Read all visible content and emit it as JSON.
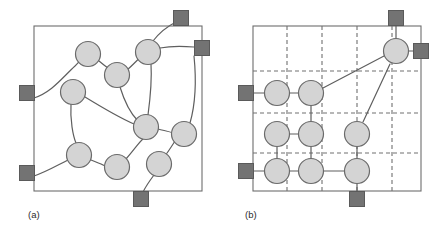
{
  "figure": {
    "background_color": "#ffffff",
    "panels": [
      {
        "id": "a",
        "label": "(a)",
        "label_x": 28,
        "label_y": 218,
        "kind": "irregular-network",
        "frame": {
          "x": 34,
          "y": 26,
          "width": 168,
          "height": 165
        },
        "style": {
          "frame_stroke": "#6d6d6d",
          "frame_fill": "#ffffff",
          "frame_stroke_width": 1.1,
          "node_fill": "#d4d4d4",
          "node_stroke": "#6a6a6a",
          "node_stroke_width": 1.2,
          "node_radius": 12.5,
          "terminal_fill": "#737373",
          "terminal_stroke": "#5a5a5a",
          "terminal_size": 15,
          "edge_stroke": "#5f5f5f",
          "edge_stroke_width": 1.2
        },
        "nodes": [
          {
            "name": "node-a1",
            "x": 88,
            "y": 54
          },
          {
            "name": "node-a2",
            "x": 148,
            "y": 52
          },
          {
            "name": "node-a3",
            "x": 117,
            "y": 75
          },
          {
            "name": "node-a4",
            "x": 73,
            "y": 92
          },
          {
            "name": "node-a5",
            "x": 146,
            "y": 127
          },
          {
            "name": "node-a6",
            "x": 184,
            "y": 134
          },
          {
            "name": "node-a7",
            "x": 79,
            "y": 155
          },
          {
            "name": "node-a8",
            "x": 117,
            "y": 167
          },
          {
            "name": "node-a9",
            "x": 159,
            "y": 164
          }
        ],
        "terminals": [
          {
            "name": "terminal-a-top",
            "x": 181,
            "y": 18
          },
          {
            "name": "terminal-a-right",
            "x": 202,
            "y": 48
          },
          {
            "name": "terminal-a-left-upper",
            "x": 27,
            "y": 93
          },
          {
            "name": "terminal-a-left-lower",
            "x": 27,
            "y": 173
          },
          {
            "name": "terminal-a-bottom",
            "x": 141,
            "y": 199
          }
        ],
        "edges": [
          {
            "name": "edge-a-left-to-n1",
            "path": "M 34 98 C 52 92 62 78 75 66 C 79 62 82 58 85 56"
          },
          {
            "name": "edge-a-n1-to-n3",
            "path": "M 99 61 C 105 66 110 70 116 73"
          },
          {
            "name": "edge-a-n3-to-n2",
            "path": "M 127 70 C 134 64 139 58 144 54"
          },
          {
            "name": "edge-a-n2-to-top",
            "path": "M 153 41 C 160 32 168 26 176 22"
          },
          {
            "name": "edge-a-n2-to-right",
            "path": "M 160 48 C 170 46 182 46 194 47"
          },
          {
            "name": "edge-a-n2-to-n5",
            "path": "M 151 64 C 152 80 150 100 148 115"
          },
          {
            "name": "edge-a-n3-to-n5",
            "path": "M 120 87 C 124 100 129 112 138 121"
          },
          {
            "name": "edge-a-n4-to-n5",
            "path": "M 85 97 C 103 108 120 118 134 124"
          },
          {
            "name": "edge-a-n4-to-n7",
            "path": "M 71 104 C 70 120 73 136 76 143"
          },
          {
            "name": "edge-a-n7-to-left",
            "path": "M 68 160 C 56 166 46 172 34 176"
          },
          {
            "name": "edge-a-n7-to-n8",
            "path": "M 91 160 C 98 163 104 165 105 166"
          },
          {
            "name": "edge-a-n8-to-n5",
            "path": "M 126 159 C 134 150 140 141 143 139"
          },
          {
            "name": "edge-a-n5-to-n6",
            "path": "M 158 129 C 166 131 172 132 172 133"
          },
          {
            "name": "edge-a-n6-to-right",
            "path": "M 190 123 C 196 102 196 76 194 56"
          },
          {
            "name": "edge-a-n6-to-n9",
            "path": "M 175 141 C 170 149 165 156 163 158"
          },
          {
            "name": "edge-a-n9-to-bot",
            "path": "M 154 175 C 148 183 144 190 143 192"
          }
        ]
      },
      {
        "id": "b",
        "label": "(b)",
        "label_x": 245,
        "label_y": 218,
        "kind": "regular-grid-network",
        "frame": {
          "x": 253,
          "y": 26,
          "width": 168,
          "height": 165
        },
        "style": {
          "frame_stroke": "#6d6d6d",
          "frame_fill": "#ffffff",
          "frame_stroke_width": 1.1,
          "grid_stroke": "#707070",
          "grid_stroke_width": 1.1,
          "grid_dash": "4,3",
          "node_fill": "#d4d4d4",
          "node_stroke": "#6a6a6a",
          "node_stroke_width": 1.2,
          "node_radius": 12.5,
          "terminal_fill": "#737373",
          "terminal_stroke": "#5a5a5a",
          "terminal_size": 15,
          "edge_stroke": "#5f5f5f",
          "edge_stroke_width": 1.2
        },
        "grid_lines_vertical_x": [
          287,
          322,
          357,
          392
        ],
        "grid_lines_horizontal_y": [
          71,
          113,
          153
        ],
        "nodes": [
          {
            "name": "node-b-top-right",
            "x": 396,
            "y": 51
          },
          {
            "name": "node-b-r1c1",
            "x": 277,
            "y": 93
          },
          {
            "name": "node-b-r1c2",
            "x": 311,
            "y": 93
          },
          {
            "name": "node-b-r2c1",
            "x": 277,
            "y": 134
          },
          {
            "name": "node-b-r2c2",
            "x": 311,
            "y": 134
          },
          {
            "name": "node-b-r2c3",
            "x": 357,
            "y": 134
          },
          {
            "name": "node-b-r3c1",
            "x": 277,
            "y": 171
          },
          {
            "name": "node-b-r3c2",
            "x": 311,
            "y": 171
          },
          {
            "name": "node-b-r3c3",
            "x": 357,
            "y": 171
          }
        ],
        "terminals": [
          {
            "name": "terminal-b-top",
            "x": 396,
            "y": 18
          },
          {
            "name": "terminal-b-right",
            "x": 421,
            "y": 51
          },
          {
            "name": "terminal-b-left-upper",
            "x": 246,
            "y": 93
          },
          {
            "name": "terminal-b-left-lower",
            "x": 246,
            "y": 171
          },
          {
            "name": "terminal-b-bottom",
            "x": 357,
            "y": 199
          }
        ],
        "edges": [
          {
            "name": "edge-b-top-to-node",
            "path": "M 396 26 L 396 38"
          },
          {
            "name": "edge-b-node-to-right",
            "path": "M 409 51 L 414 51"
          },
          {
            "name": "edge-b-left-to-r1c1",
            "path": "M 253 93 L 264 93"
          },
          {
            "name": "edge-b-r1c1-to-r1c2",
            "path": "M 290 93 L 298 93"
          },
          {
            "name": "edge-b-r1c2-to-topright",
            "path": "M 323 88 L 384 56"
          },
          {
            "name": "edge-b-r1c2-to-r2c2",
            "path": "M 311 106 L 311 121"
          },
          {
            "name": "edge-b-r2c1-to-r2c2",
            "path": "M 290 134 L 298 134"
          },
          {
            "name": "edge-b-r2c1-to-r3c1",
            "path": "M 277 147 L 277 158"
          },
          {
            "name": "edge-b-r2c2-to-r3c2",
            "path": "M 311 147 L 311 158"
          },
          {
            "name": "edge-b-r2c3-to-topright",
            "path": "M 363 122 L 390 64"
          },
          {
            "name": "edge-b-r2c3-to-r3c3",
            "path": "M 357 147 L 357 158"
          },
          {
            "name": "edge-b-left-to-r3c1",
            "path": "M 253 171 L 264 171"
          },
          {
            "name": "edge-b-r3c1-to-r3c2",
            "path": "M 290 171 L 298 171"
          },
          {
            "name": "edge-b-r3c2-to-r3c3",
            "path": "M 324 171 L 344 171"
          },
          {
            "name": "edge-b-r3c3-to-bottom",
            "path": "M 357 184 L 357 192"
          }
        ]
      }
    ]
  }
}
